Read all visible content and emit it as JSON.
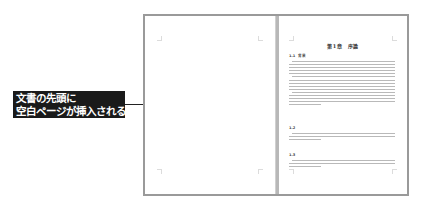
{
  "callout": {
    "lines": [
      "文書の先頭に",
      "空白ページが挿入される"
    ]
  },
  "spread": {
    "left_page": {
      "state": "blank"
    },
    "right_page": {
      "chapter_title": "第1章　序論",
      "sections": [
        {
          "number": "1.1",
          "title": "背景",
          "line_count": 17
        },
        {
          "number": "1.2",
          "title": "",
          "line_count": 3
        },
        {
          "number": "1.3",
          "title": "",
          "line_count": 3
        }
      ]
    }
  },
  "colors": {
    "callout_bg": "#1a1a1a",
    "callout_text": "#ffffff",
    "frame": "#9a9a9a",
    "divider": "#b8b8b8",
    "text_lines": "#b9b9b9"
  }
}
